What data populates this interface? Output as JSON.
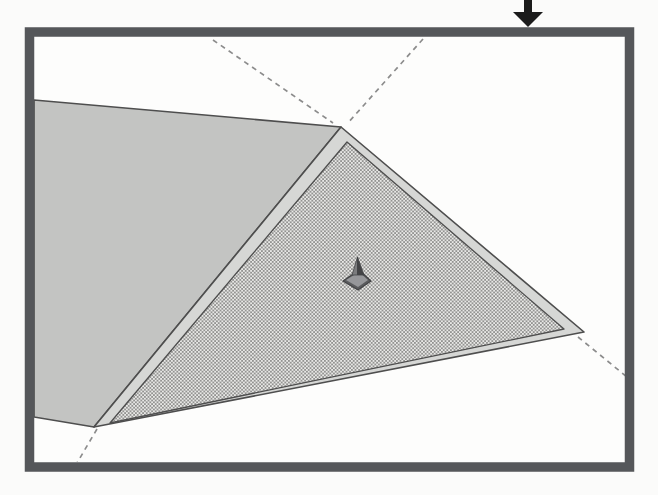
{
  "figure": {
    "alt": "Scanned line drawing: a rectangular frame with a black arrow pointing down at its top edge; inside, a solid gray plane folds at a ridge into a stippled triangular plane with a thin light rim (slab edge); dashed lines extend the fold edges beyond the corners; a tiny dark pointer object sits on the stippled surface",
    "canvas": {
      "width": 658,
      "height": 495
    },
    "colors": {
      "page_bg": "#fbfbfa",
      "frame_interior": "#fdfdfc",
      "frame_border": "#55575a",
      "arrow_black": "#1b1b1b",
      "plane_gray": "#c3c4c2",
      "rim_gray": "#d6d7d5",
      "stipple_bg": "#e8e8e6",
      "stipple_dot": "#6e6e6c",
      "edge_line": "#4e4e4e",
      "dash_gray": "#8c8c8c",
      "marker_dark": "#434446",
      "marker_mid": "#5b5c5e",
      "marker_light": "#96979a",
      "marker_facet": "#7b7c7e"
    },
    "frame": {
      "inner": {
        "x": 34,
        "y": 37,
        "w": 591,
        "h": 425
      },
      "border_rect": {
        "x": 29.5,
        "y": 32,
        "w": 600,
        "h": 435,
        "thickness": 9.5
      }
    },
    "stipple": {
      "tile_w": 3.6,
      "tile_h": 3.6,
      "dot_r": 0.85,
      "dots": [
        [
          0.9,
          0.9
        ],
        [
          2.7,
          2.7
        ]
      ],
      "bg": "stipple_bg",
      "dot_color": "stipple_dot"
    },
    "shapes": [
      {
        "name": "frame-interior",
        "layer": "clipped",
        "el": "rect",
        "x": 34,
        "y": 37,
        "w": 591,
        "h": 425,
        "fill": "frame_interior"
      },
      {
        "name": "left-plane-surface",
        "layer": "clipped",
        "el": "polygon",
        "points": [
          [
            34,
            100
          ],
          [
            341,
            127
          ],
          [
            94,
            427
          ],
          [
            34,
            417
          ]
        ],
        "fill": "plane_gray",
        "stroke": "edge_line",
        "sw": 1.6
      },
      {
        "name": "slab-edge-rim",
        "layer": "clipped",
        "el": "polygon",
        "points": [
          [
            341,
            127
          ],
          [
            584,
            332
          ],
          [
            94,
            427
          ]
        ],
        "fill": "rim_gray",
        "stroke": "edge_line",
        "sw": 1.6
      },
      {
        "name": "stippled-plane-surface",
        "layer": "clipped",
        "el": "polygon",
        "points": [
          [
            347,
            142
          ],
          [
            564,
            329
          ],
          [
            110,
            423
          ]
        ],
        "fill": "@stipple",
        "stroke": "edge_line",
        "sw": 1.3
      },
      {
        "name": "fold-line-upper-left",
        "layer": "clipped",
        "el": "line",
        "x1": 213,
        "y1": 40,
        "x2": 333,
        "y2": 123,
        "stroke": "dash_gray",
        "sw": 1.7,
        "dash": "5 4.5"
      },
      {
        "name": "fold-line-upper-right",
        "layer": "clipped",
        "el": "line",
        "x1": 423,
        "y1": 39,
        "x2": 347,
        "y2": 124,
        "stroke": "dash_gray",
        "sw": 1.7,
        "dash": "5 4.5"
      },
      {
        "name": "fold-line-lower-left",
        "layer": "clipped",
        "el": "line",
        "x1": 97,
        "y1": 429,
        "x2": 77,
        "y2": 463,
        "stroke": "dash_gray",
        "sw": 1.7,
        "dash": "5 4.5"
      },
      {
        "name": "fold-line-lower-right",
        "layer": "clipped",
        "el": "line",
        "x1": 578,
        "y1": 337,
        "x2": 627,
        "y2": 377,
        "stroke": "dash_gray",
        "sw": 1.7,
        "dash": "5 4.5"
      },
      {
        "name": "marker-base-plate",
        "layer": "clipped",
        "el": "polygon",
        "points": [
          [
            343,
            281
          ],
          [
            359,
            270
          ],
          [
            371,
            281
          ],
          [
            358,
            290
          ]
        ],
        "fill": "marker_mid",
        "stroke": "marker_dark",
        "sw": 1.2
      },
      {
        "name": "marker-base-top-face",
        "layer": "clipped",
        "el": "polygon",
        "points": [
          [
            346,
            280
          ],
          [
            359,
            272
          ],
          [
            368,
            280
          ],
          [
            358,
            287
          ]
        ],
        "fill": "marker_light"
      },
      {
        "name": "marker-spike-left-facet",
        "layer": "clipped",
        "el": "polygon",
        "points": [
          [
            352,
            275
          ],
          [
            357.5,
            257
          ],
          [
            357.5,
            275
          ]
        ],
        "fill": "marker_facet",
        "stroke": "marker_dark",
        "sw": 0.8
      },
      {
        "name": "marker-spike-right-facet",
        "layer": "clipped",
        "el": "polygon",
        "points": [
          [
            357.5,
            257
          ],
          [
            364,
            275
          ],
          [
            357.5,
            275
          ]
        ],
        "fill": "marker_dark",
        "stroke": "marker_dark",
        "sw": 0.8
      },
      {
        "name": "frame-border",
        "layer": "root",
        "el": "rect",
        "x": 29.5,
        "y": 32,
        "w": 600,
        "h": 435,
        "fill": "none",
        "stroke": "frame_border",
        "sw": 9.5
      },
      {
        "name": "pointer-arrow-shaft",
        "layer": "root",
        "el": "rect",
        "x": 524,
        "y": 0,
        "w": 8,
        "h": 13.5,
        "fill": "arrow_black"
      },
      {
        "name": "pointer-arrow-head",
        "layer": "root",
        "el": "polygon",
        "points": [
          [
            513,
            12
          ],
          [
            543,
            12
          ],
          [
            528,
            27
          ]
        ],
        "fill": "arrow_black"
      }
    ]
  }
}
